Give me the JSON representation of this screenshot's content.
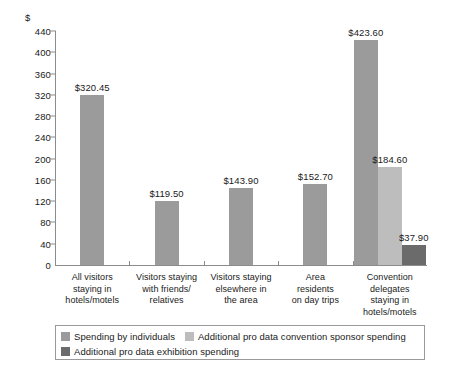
{
  "chart_data": {
    "type": "bar",
    "title": "",
    "subtitle": "",
    "xlabel": "",
    "ylabel": "$",
    "ylim": [
      0,
      440
    ],
    "ytick_step": 40,
    "grid": false,
    "legend_position": "bottom",
    "yticks": [
      "440",
      "400",
      "360",
      "320",
      "280",
      "240",
      "200",
      "160",
      "120",
      "80",
      "40",
      "0"
    ],
    "ytick_values": [
      440,
      400,
      360,
      320,
      280,
      240,
      200,
      160,
      120,
      80,
      40,
      0
    ],
    "categories": [
      "All visitors\nstaying in\nhotels/motels",
      "Visitors staying\nwith friends/\nrelatives",
      "Visitors staying\nelsewhere in\nthe area",
      "Area\nresidents\non day trips",
      "Convention\ndelegates\nstaying in\nhotels/motels"
    ],
    "series": [
      {
        "name": "Spending by individuals",
        "color": "#9b9b9b",
        "values": [
          320.45,
          119.5,
          143.9,
          152.7,
          423.6
        ],
        "labels": [
          "$320.45",
          "$119.50",
          "$143.90",
          "$152.70",
          "$423.60"
        ]
      },
      {
        "name": "Additional pro data convention sponsor spending",
        "color": "#bdbdbd",
        "values": [
          null,
          null,
          null,
          null,
          184.6
        ],
        "labels": [
          "",
          "",
          "",
          "",
          "$184.60"
        ]
      },
      {
        "name": "Additional pro data exhibition spending",
        "color": "#6b6b6b",
        "values": [
          null,
          null,
          null,
          null,
          37.9
        ],
        "labels": [
          "",
          "",
          "",
          "",
          "$37.90"
        ]
      }
    ]
  },
  "legend": {
    "items": [
      {
        "label": "Spending by individuals",
        "color": "#9b9b9b"
      },
      {
        "label": "Additional pro data convention sponsor spending",
        "color": "#bdbdbd"
      },
      {
        "label": "Additional pro data exhibition spending",
        "color": "#6b6b6b"
      }
    ]
  },
  "axis": {
    "unit_label": "$"
  }
}
